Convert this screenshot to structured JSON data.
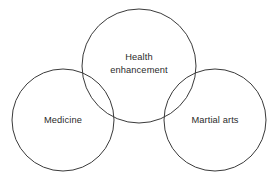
{
  "diagram": {
    "type": "venn-tangent-circles",
    "background_color": "#ffffff",
    "stroke_color": "#3a3a3a",
    "text_color": "#2b2b2b",
    "circles": [
      {
        "id": "health-enhancement",
        "label_lines": [
          "Health",
          "enhancement"
        ],
        "cx": 139,
        "cy": 66,
        "r": 57
      },
      {
        "id": "medicine",
        "label": "Medicine",
        "cx": 63,
        "cy": 120,
        "r": 51
      },
      {
        "id": "martial-arts",
        "label": "Martial arts",
        "cx": 215,
        "cy": 120,
        "r": 51
      }
    ]
  }
}
